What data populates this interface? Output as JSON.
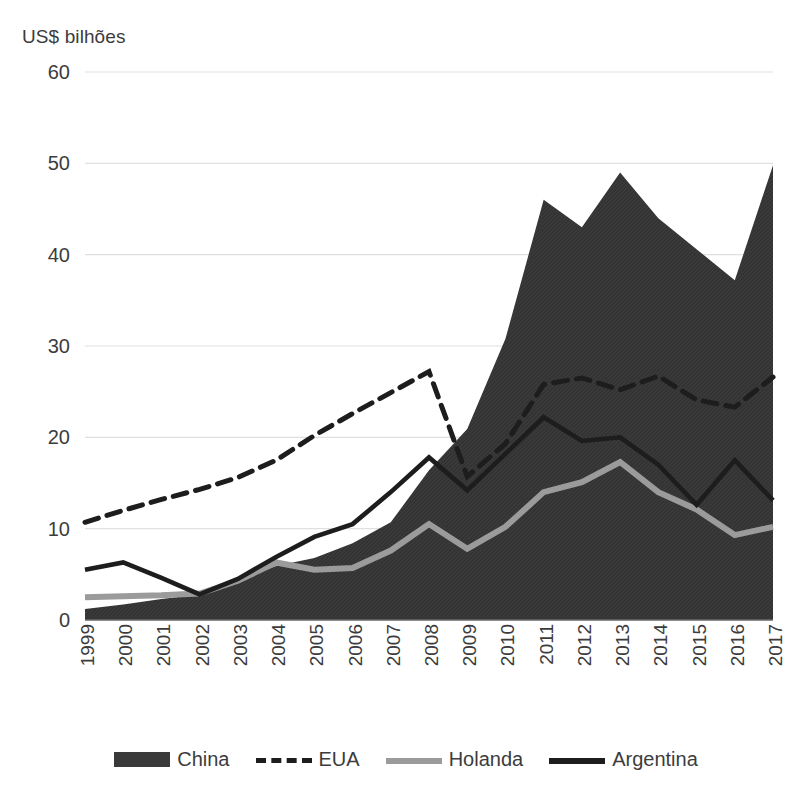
{
  "chart_data": {
    "type": "area",
    "title": "",
    "ylabel": "US$ bilhões",
    "xlabel": "",
    "ylim": [
      0,
      60
    ],
    "yticks": [
      0,
      10,
      20,
      30,
      40,
      50,
      60
    ],
    "grid": true,
    "legend_position": "bottom",
    "x": [
      1999,
      2000,
      2001,
      2002,
      2003,
      2004,
      2005,
      2006,
      2007,
      2008,
      2009,
      2010,
      2011,
      2012,
      2013,
      2014,
      2015,
      2016,
      2017
    ],
    "categories": [
      "1999",
      "2000",
      "2001",
      "2002",
      "2003",
      "2004",
      "2005",
      "2006",
      "2007",
      "2008",
      "2009",
      "2010",
      "2011",
      "2012",
      "2013",
      "2014",
      "2015",
      "2016",
      "2017"
    ],
    "series": [
      {
        "name": "China",
        "style": "area",
        "color": "#3a3a3a",
        "values": [
          1.2,
          1.7,
          2.3,
          2.8,
          4.4,
          5.9,
          6.8,
          8.4,
          10.7,
          16.4,
          20.9,
          30.8,
          46.0,
          43.0,
          49.0,
          44.0,
          40.6,
          37.2,
          49.8
        ]
      },
      {
        "name": "EUA",
        "style": "dashed-line",
        "color": "#1d1d1d",
        "values": [
          10.7,
          12.0,
          13.2,
          14.3,
          15.6,
          17.5,
          20.2,
          22.6,
          24.9,
          27.2,
          15.7,
          19.3,
          25.8,
          26.5,
          25.2,
          26.7,
          24.1,
          23.3,
          26.6
        ]
      },
      {
        "name": "Holanda",
        "style": "line",
        "color": "#9b9b9b",
        "values": [
          2.5,
          2.6,
          2.7,
          2.9,
          4.3,
          6.3,
          5.5,
          5.7,
          7.6,
          10.5,
          7.8,
          10.2,
          14.0,
          15.1,
          17.3,
          14.0,
          12.1,
          9.3,
          10.2
        ]
      },
      {
        "name": "Argentina",
        "style": "line",
        "color": "#1d1d1d",
        "values": [
          5.5,
          6.3,
          4.6,
          2.8,
          4.5,
          6.9,
          9.1,
          10.5,
          14.0,
          17.8,
          14.2,
          18.2,
          22.2,
          19.6,
          20.0,
          17.0,
          12.6,
          17.5,
          13.1
        ]
      }
    ]
  },
  "legend": {
    "items": [
      {
        "label": "China",
        "icon": "area-swatch-icon"
      },
      {
        "label": "EUA",
        "icon": "dashed-line-swatch-icon"
      },
      {
        "label": "Holanda",
        "icon": "gray-line-swatch-icon"
      },
      {
        "label": "Argentina",
        "icon": "solid-line-swatch-icon"
      }
    ]
  },
  "colors": {
    "area_fill": "#3a3a3a",
    "eua_line": "#1d1d1d",
    "holanda_line": "#9b9b9b",
    "argentina_line": "#1d1d1d",
    "gridline": "#e0e0e0",
    "text": "#3c3c3c",
    "background": "#ffffff"
  }
}
